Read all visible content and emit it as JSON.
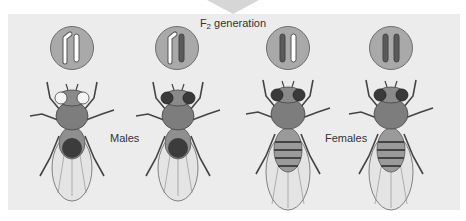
{
  "title": {
    "prefix": "F",
    "subscript": "2",
    "suffix": " generation"
  },
  "groups": {
    "males_label": "Males",
    "females_label": "Females"
  },
  "colors": {
    "panel_bg": "#ececec",
    "circle_fill": "#a9a9a9",
    "red_chromosome": "#5a5a5a",
    "white_chromosome": "#ffffff"
  },
  "individuals": [
    {
      "sex": "male",
      "eye_color": "white",
      "chromosomes": [
        "Y",
        "X (white)"
      ]
    },
    {
      "sex": "male",
      "eye_color": "red",
      "chromosomes": [
        "Y",
        "X (red)"
      ]
    },
    {
      "sex": "female",
      "eye_color": "red",
      "chromosomes": [
        "X (red)",
        "X (white)"
      ]
    },
    {
      "sex": "female",
      "eye_color": "red",
      "chromosomes": [
        "X (red)",
        "X (red)"
      ]
    }
  ]
}
